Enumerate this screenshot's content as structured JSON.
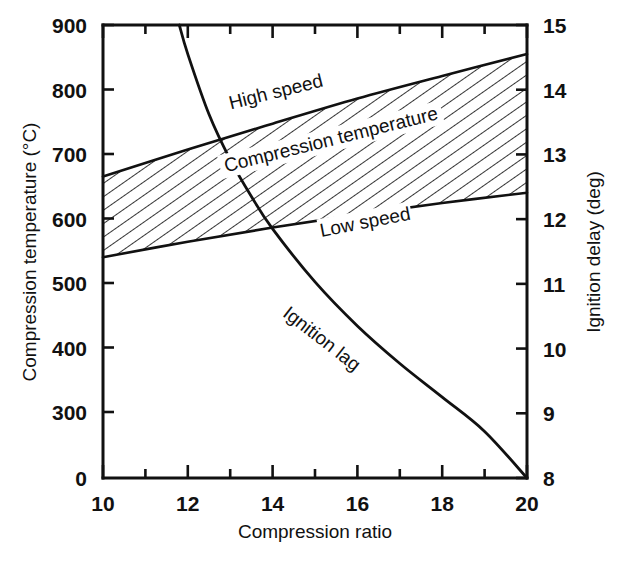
{
  "chart_data": {
    "type": "line",
    "title": "",
    "xlabel": "Compression ratio",
    "ylabel": "Compression temperature (°C)",
    "y2label": "Ignition delay (deg)",
    "xlim": [
      10,
      20
    ],
    "xticks": [
      10,
      12,
      14,
      16,
      18,
      20
    ],
    "xtick_labels": [
      "10",
      "12",
      "14",
      "16",
      "18",
      "20"
    ],
    "x_minor_ticks": [
      11,
      13,
      15,
      17,
      19
    ],
    "ylim": [
      300,
      900
    ],
    "yticks": [
      300,
      400,
      500,
      600,
      700,
      800,
      900
    ],
    "ytick_labels": [
      "300",
      "400",
      "500",
      "600",
      "700",
      "800",
      "900"
    ],
    "y_axis_break_label": "0",
    "y_axis_break_note": "axis broken below 300; baseline tick labelled 0",
    "y2lim": [
      8,
      15
    ],
    "y2ticks": [
      8,
      9,
      10,
      11,
      12,
      13,
      14,
      15
    ],
    "y2tick_labels": [
      "8",
      "9",
      "10",
      "11",
      "12",
      "13",
      "14",
      "15"
    ],
    "grid": false,
    "legend": "none",
    "series": [
      {
        "name": "High speed",
        "axis": "left",
        "description": "Upper boundary of compression temperature band",
        "x": [
          10,
          12,
          14,
          16,
          18,
          20
        ],
        "y": [
          665,
          707,
          747,
          786,
          821,
          855
        ]
      },
      {
        "name": "Low speed",
        "axis": "left",
        "description": "Lower boundary of compression temperature band",
        "x": [
          10,
          12,
          14,
          16,
          18,
          20
        ],
        "y": [
          540,
          564,
          586,
          606,
          624,
          640
        ]
      },
      {
        "name": "Ignition lag",
        "axis": "right",
        "description": "Ignition delay versus compression ratio",
        "x": [
          11.8,
          12.0,
          12.5,
          13.0,
          13.5,
          14.0,
          15.0,
          16.0,
          17.0,
          18.0,
          19.0,
          20.0
        ],
        "y": [
          15.0,
          14.55,
          13.62,
          12.92,
          12.35,
          11.85,
          11.03,
          10.35,
          9.77,
          9.25,
          8.72,
          8.0
        ]
      }
    ],
    "annotations": [
      {
        "text": "High speed",
        "x": 14.1,
        "y": 790,
        "axis": "left",
        "rotation": -14
      },
      {
        "text": "Compression temperature",
        "x": 15.4,
        "y": 716,
        "axis": "left",
        "rotation": -14
      },
      {
        "text": "Low speed",
        "x": 16.2,
        "y": 588,
        "axis": "left",
        "rotation": -11
      },
      {
        "text": "Ignition lag",
        "x": 15.1,
        "y": 10.1,
        "axis": "right",
        "rotation": 38
      }
    ],
    "band": {
      "name": "Compression temperature",
      "fill": "hatched-diagonal",
      "hatch_color": "#111111",
      "background": "#ffffff"
    },
    "colors": {
      "axis": "#111111",
      "curve": "#111111",
      "background": "#ffffff"
    }
  },
  "axes": {
    "left": {
      "title": "Compression temperature (°C)",
      "ticks": [
        {
          "label": "900",
          "value": 900
        },
        {
          "label": "800",
          "value": 800
        },
        {
          "label": "700",
          "value": 700
        },
        {
          "label": "600",
          "value": 600
        },
        {
          "label": "500",
          "value": 500
        },
        {
          "label": "400",
          "value": 400
        },
        {
          "label": "300",
          "value": 300
        },
        {
          "label": "0",
          "value": 0
        }
      ]
    },
    "right": {
      "title": "Ignition delay (deg)",
      "ticks": [
        {
          "label": "15",
          "value": 15
        },
        {
          "label": "14",
          "value": 14
        },
        {
          "label": "13",
          "value": 13
        },
        {
          "label": "12",
          "value": 12
        },
        {
          "label": "11",
          "value": 11
        },
        {
          "label": "10",
          "value": 10
        },
        {
          "label": "9",
          "value": 9
        },
        {
          "label": "8",
          "value": 8
        }
      ]
    },
    "bottom": {
      "title": "Compression ratio",
      "ticks": [
        {
          "label": "10",
          "value": 10
        },
        {
          "label": "12",
          "value": 12
        },
        {
          "label": "14",
          "value": 14
        },
        {
          "label": "16",
          "value": 16
        },
        {
          "label": "18",
          "value": 18
        },
        {
          "label": "20",
          "value": 20
        }
      ]
    }
  },
  "labels": {
    "high_speed": "High speed",
    "compression_temperature": "Compression temperature",
    "low_speed": "Low speed",
    "ignition_lag": "Ignition lag"
  }
}
